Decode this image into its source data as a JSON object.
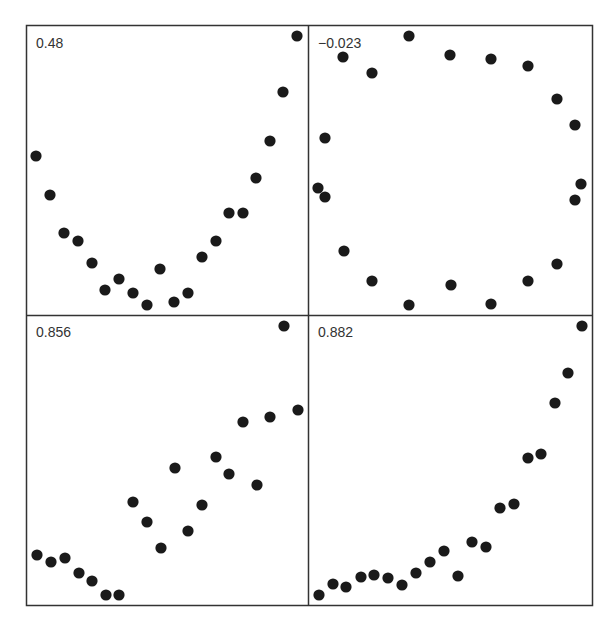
{
  "chart_data": [
    {
      "type": "scatter",
      "panel": "top-left",
      "annotation": "0.48",
      "grid": false,
      "points": [
        [
          1,
          12.6
        ],
        [
          2,
          10.3
        ],
        [
          3,
          7.8
        ],
        [
          4,
          7.3
        ],
        [
          5,
          5.9
        ],
        [
          6,
          4.4
        ],
        [
          7,
          5.0
        ],
        [
          8,
          4.2
        ],
        [
          9,
          3.4
        ],
        [
          10,
          5.6
        ],
        [
          11,
          3.6
        ],
        [
          12,
          4.2
        ],
        [
          13,
          6.8
        ],
        [
          14,
          7.8
        ],
        [
          15,
          9.7
        ],
        [
          16,
          9.7
        ],
        [
          17,
          11.7
        ],
        [
          18,
          14.0
        ],
        [
          19,
          17.1
        ],
        [
          20,
          20.6
        ]
      ]
    },
    {
      "type": "scatter",
      "panel": "top-right",
      "annotation": "−0.023",
      "grid": false,
      "points": [
        [
          0.1,
          10.4
        ],
        [
          0.5,
          14.0
        ],
        [
          0.6,
          10.0
        ],
        [
          1.8,
          19.4
        ],
        [
          1.7,
          6.9
        ],
        [
          3.9,
          18.5
        ],
        [
          3.9,
          5.0
        ],
        [
          6.6,
          20.6
        ],
        [
          6.6,
          3.4
        ],
        [
          9.5,
          19.4
        ],
        [
          9.5,
          4.8
        ],
        [
          12.4,
          19.1
        ],
        [
          12.4,
          3.5
        ],
        [
          14.9,
          18.7
        ],
        [
          14.9,
          5.0
        ],
        [
          16.8,
          16.6
        ],
        [
          16.8,
          6.1
        ],
        [
          18.0,
          14.9
        ],
        [
          18.0,
          10.0
        ],
        [
          18.4,
          11.0
        ]
      ]
    },
    {
      "type": "scatter",
      "panel": "bottom-left",
      "annotation": "0.856",
      "grid": false,
      "points": [
        [
          1,
          5.4
        ],
        [
          2,
          4.8
        ],
        [
          3,
          5.1
        ],
        [
          4,
          4.0
        ],
        [
          5,
          3.6
        ],
        [
          6,
          2.6
        ],
        [
          7,
          2.6
        ],
        [
          8,
          9.1
        ],
        [
          9,
          7.6
        ],
        [
          10,
          6.1
        ],
        [
          11,
          11.4
        ],
        [
          12,
          7.0
        ],
        [
          13,
          8.2
        ],
        [
          14,
          10.9
        ],
        [
          15,
          12.1
        ],
        [
          16,
          11.4
        ],
        [
          17,
          15.2
        ],
        [
          18,
          10.4
        ],
        [
          19,
          15.7
        ],
        [
          20,
          21.3
        ],
        [
          21,
          16.2
        ]
      ]
    },
    {
      "type": "scatter",
      "panel": "bottom-right",
      "annotation": "0.882",
      "grid": false,
      "points": [
        [
          1,
          3.0
        ],
        [
          2,
          3.8
        ],
        [
          3,
          3.5
        ],
        [
          4,
          4.3
        ],
        [
          5,
          4.5
        ],
        [
          6,
          3.9
        ],
        [
          7,
          3.6
        ],
        [
          8,
          4.4
        ],
        [
          9,
          5.3
        ],
        [
          10,
          6.1
        ],
        [
          11,
          4.3
        ],
        [
          12,
          7.0
        ],
        [
          13,
          6.6
        ],
        [
          14,
          9.4
        ],
        [
          15,
          9.7
        ],
        [
          16,
          13.5
        ],
        [
          17,
          13.8
        ],
        [
          18,
          17.7
        ],
        [
          19,
          19.8
        ],
        [
          20,
          23.0
        ]
      ]
    }
  ],
  "panels": [
    {
      "id": "tl",
      "label": "0.48"
    },
    {
      "id": "tr",
      "label": "−0.023"
    },
    {
      "id": "bl",
      "label": "0.856"
    },
    {
      "id": "br",
      "label": "0.882"
    }
  ],
  "pixel_points": {
    "tl": [
      [
        36,
        156
      ],
      [
        50,
        195
      ],
      [
        64,
        233
      ],
      [
        78,
        241
      ],
      [
        92,
        263
      ],
      [
        105,
        290
      ],
      [
        119,
        279
      ],
      [
        133,
        293
      ],
      [
        147,
        305
      ],
      [
        160,
        269
      ],
      [
        174,
        302
      ],
      [
        188,
        293
      ],
      [
        202,
        257
      ],
      [
        216,
        241
      ],
      [
        229,
        213
      ],
      [
        243,
        213
      ],
      [
        256,
        178
      ],
      [
        270,
        141
      ],
      [
        283,
        92
      ],
      [
        297,
        36
      ]
    ],
    "tr": [
      [
        318,
        188
      ],
      [
        325,
        138
      ],
      [
        325,
        197
      ],
      [
        343,
        57
      ],
      [
        344,
        251
      ],
      [
        372,
        73
      ],
      [
        372,
        281
      ],
      [
        409,
        36
      ],
      [
        409,
        305
      ],
      [
        450,
        55
      ],
      [
        451,
        285
      ],
      [
        491,
        59
      ],
      [
        491,
        304
      ],
      [
        528,
        66
      ],
      [
        528,
        281
      ],
      [
        557,
        99
      ],
      [
        557,
        264
      ],
      [
        575,
        125
      ],
      [
        575,
        200
      ],
      [
        581,
        184
      ]
    ],
    "bl": [
      [
        37,
        555
      ],
      [
        51,
        562
      ],
      [
        65,
        558
      ],
      [
        79,
        573
      ],
      [
        92,
        581
      ],
      [
        106,
        595
      ],
      [
        119,
        595
      ],
      [
        133,
        502
      ],
      [
        147,
        522
      ],
      [
        161,
        548
      ],
      [
        175,
        468
      ],
      [
        188,
        531
      ],
      [
        202,
        505
      ],
      [
        216,
        457
      ],
      [
        229,
        474
      ],
      [
        243,
        422
      ],
      [
        257,
        485
      ],
      [
        270,
        417
      ],
      [
        284,
        326
      ],
      [
        298,
        410
      ]
    ],
    "br": [
      [
        319,
        595
      ],
      [
        333,
        584
      ],
      [
        346,
        587
      ],
      [
        361,
        577
      ],
      [
        374,
        575
      ],
      [
        388,
        578
      ],
      [
        402,
        585
      ],
      [
        416,
        573
      ],
      [
        430,
        562
      ],
      [
        444,
        551
      ],
      [
        458,
        576
      ],
      [
        472,
        542
      ],
      [
        486,
        547
      ],
      [
        500,
        508
      ],
      [
        514,
        504
      ],
      [
        528,
        458
      ],
      [
        541,
        454
      ],
      [
        555,
        403
      ],
      [
        568,
        373
      ],
      [
        582,
        326
      ]
    ]
  }
}
